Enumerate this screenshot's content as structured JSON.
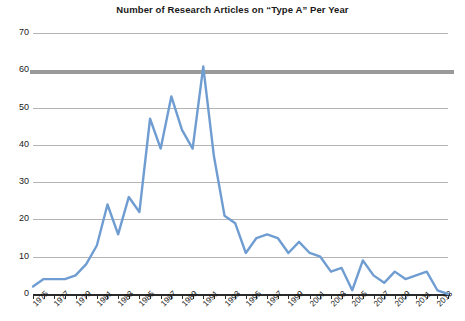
{
  "chart_data": {
    "type": "line",
    "title": "Number of Research Articles on “Type A” Per Year",
    "xlabel": "",
    "ylabel": "",
    "ylim": [
      0,
      70
    ],
    "ytick_values": [
      0,
      10,
      20,
      30,
      40,
      50,
      60,
      70
    ],
    "ytick_labels": [
      "0",
      "10",
      "20",
      "30",
      "40",
      "50",
      "60",
      "70"
    ],
    "grid": true,
    "legend": "none",
    "line_color": "#6f9dd1",
    "x": [
      1975,
      1976,
      1977,
      1978,
      1979,
      1980,
      1981,
      1982,
      1983,
      1984,
      1985,
      1986,
      1987,
      1988,
      1989,
      1990,
      1991,
      1992,
      1993,
      1994,
      1995,
      1996,
      1997,
      1998,
      1999,
      2000,
      2001,
      2002,
      2003,
      2004,
      2005,
      2006,
      2007,
      2008,
      2009,
      2010,
      2011,
      2012,
      2013,
      2014
    ],
    "values": [
      2,
      4,
      4,
      4,
      5,
      8,
      13,
      24,
      16,
      26,
      22,
      47,
      39,
      53,
      44,
      39,
      61,
      37,
      21,
      19,
      11,
      15,
      16,
      15,
      11,
      14,
      11,
      10,
      6,
      7,
      1,
      9,
      5,
      3,
      6,
      4,
      5,
      6,
      1,
      0
    ],
    "xtick_labels": [
      "1975",
      "1977",
      "1979",
      "1981",
      "1983",
      "1985",
      "1987",
      "1989",
      "1991",
      "1993",
      "1995",
      "1997",
      "1999",
      "2001",
      "2003",
      "2005",
      "2007",
      "2009",
      "2011",
      "2013"
    ],
    "xtick_years": [
      1975,
      1977,
      1979,
      1981,
      1983,
      1985,
      1987,
      1989,
      1991,
      1993,
      1995,
      1997,
      1999,
      2001,
      2003,
      2005,
      2007,
      2009,
      2011,
      2013
    ],
    "x_range": [
      1975,
      2014
    ],
    "highlight_band_value": 60
  }
}
